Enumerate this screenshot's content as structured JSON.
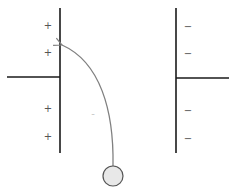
{
  "diagram": {
    "colors": {
      "background": "#ffffff",
      "plate": "#1a1a1a",
      "trajectory": "#808080",
      "particle_fill": "#e8e8e8",
      "particle_stroke": "#555555",
      "sign": "#555555",
      "faint_sign": "#c8c8c8"
    },
    "left_plate": {
      "charge": "positive",
      "signs": [
        "+",
        "+",
        "+",
        "+"
      ]
    },
    "right_plate": {
      "charge": "negative",
      "signs": [
        "−",
        "−",
        "−",
        "−"
      ]
    },
    "field_region": {
      "faint_mark": "-"
    },
    "particle": {
      "shape": "circle"
    },
    "trajectory": {
      "arrow_direction": "toward-left-plate"
    }
  }
}
